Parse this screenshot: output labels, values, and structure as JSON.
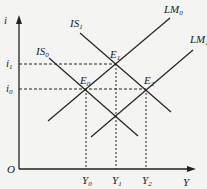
{
  "diagram": {
    "type": "IS-LM",
    "axes": {
      "y_label": "i",
      "x_label": "Y",
      "origin_label": "O"
    },
    "curves": [
      {
        "id": "IS0",
        "base": "IS",
        "sub": "0",
        "x1": 49,
        "y1": 58,
        "x2": 138,
        "y2": 136,
        "label_x": 36,
        "label_y": 55
      },
      {
        "id": "IS1",
        "base": "IS",
        "sub": "1",
        "x1": 80,
        "y1": 33,
        "x2": 171,
        "y2": 112,
        "label_x": 70,
        "label_y": 27
      },
      {
        "id": "LM0",
        "base": "LM",
        "sub": "0",
        "x1": 48,
        "y1": 121,
        "x2": 170,
        "y2": 18,
        "label_x": 164,
        "label_y": 13
      },
      {
        "id": "LM1",
        "base": "LM",
        "sub": "1",
        "x1": 91,
        "y1": 137,
        "x2": 193,
        "y2": 50,
        "label_x": 190,
        "label_y": 43
      }
    ],
    "equilibria": [
      {
        "id": "E0",
        "base": "E",
        "sub": "0",
        "x": 86,
        "y": 89,
        "label_x": 80,
        "label_y": 84
      },
      {
        "id": "E1",
        "base": "E",
        "sub": "1",
        "x": 116,
        "y": 64,
        "label_x": 110,
        "label_y": 58
      },
      {
        "id": "E2",
        "base": "E",
        "sub": "2",
        "x": 146,
        "y": 89,
        "label_x": 144,
        "label_y": 84
      }
    ],
    "y_ticks": [
      {
        "base": "i",
        "sub": "1",
        "y": 64
      },
      {
        "base": "i",
        "sub": "0",
        "y": 89
      }
    ],
    "x_ticks": [
      {
        "base": "Y",
        "sub": "0",
        "x": 86
      },
      {
        "base": "Y",
        "sub": "1",
        "x": 116
      },
      {
        "base": "Y",
        "sub": "2",
        "x": 146
      }
    ],
    "colors": {
      "line": "#222222",
      "background": "#f4f4f2"
    }
  }
}
